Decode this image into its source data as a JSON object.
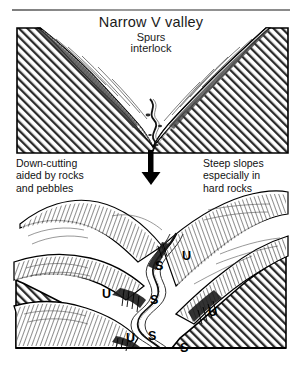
{
  "figure": {
    "title": "Narrow V valley",
    "subtitle_line1": "Spurs",
    "subtitle_line2": "interlock",
    "caption_left": {
      "line1": "Down-cutting",
      "line2": "aided by rocks",
      "line3": "and pebbles"
    },
    "caption_right": {
      "line1": "Steep slopes",
      "line2": "especially in",
      "line3": "hard rocks"
    },
    "caption_bottom_clipped": "",
    "arrow": {
      "name": "down-arrow",
      "direction": "down"
    }
  },
  "diagram_top": {
    "name": "v-valley-cross-section",
    "description": "Cross-section block of a narrow V-shaped valley with hatched bedrock"
  },
  "diagram_bottom": {
    "name": "interlocking-spurs-block-diagram",
    "description": "Three-dimensional block diagram of a river winding between interlocking spurs",
    "spur_labels": [
      {
        "text": "S",
        "x": 146,
        "y": 78
      },
      {
        "text": "U",
        "x": 172,
        "y": 68
      },
      {
        "text": "U",
        "x": 95,
        "y": 105
      },
      {
        "text": "S",
        "x": 142,
        "y": 112
      },
      {
        "text": "U",
        "x": 198,
        "y": 123
      },
      {
        "text": "U",
        "x": 120,
        "y": 150
      },
      {
        "text": "S",
        "x": 142,
        "y": 148
      },
      {
        "text": "S",
        "x": 172,
        "y": 160
      }
    ]
  },
  "colors": {
    "ink": "#111111",
    "rule": "#8a8a8a",
    "hatch": "#2b2b2b",
    "paper": "#ffffff"
  }
}
